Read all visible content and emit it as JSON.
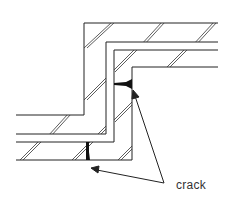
{
  "diagram": {
    "type": "cross-section",
    "annotations": [
      {
        "id": "crack-label",
        "text": "crack",
        "points_to": [
          "crack-horizontal-upper",
          "crack-vertical-lower"
        ]
      }
    ],
    "cracks": [
      {
        "id": "crack-horizontal-upper",
        "orientation": "horizontal"
      },
      {
        "id": "crack-vertical-lower",
        "orientation": "vertical"
      }
    ],
    "colors": {
      "line": "#222222",
      "background": "#ffffff",
      "text": "#333333"
    }
  }
}
